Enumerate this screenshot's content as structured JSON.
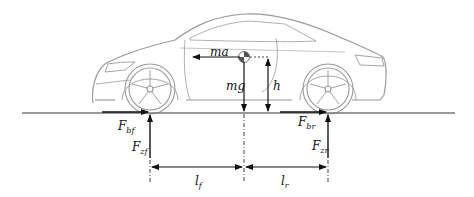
{
  "diagram": {
    "type": "vehicle braking free-body diagram",
    "labels": {
      "ma": "ma",
      "mg": "mg",
      "h": "h",
      "F_bf_main": "F",
      "F_bf_sub": "bf",
      "F_zf_main": "F",
      "F_zf_sub": "zf",
      "F_br_main": "F",
      "F_br_sub": "br",
      "F_zr_main": "F",
      "F_zr_sub": "zr",
      "l_f_main": "l",
      "l_f_sub": "f",
      "l_r_main": "l",
      "l_r_sub": "r"
    },
    "colors": {
      "car_outline": "#9a9a9a",
      "arrows": "#111111",
      "ground": "#777777",
      "cg_fill": "#555555"
    }
  }
}
